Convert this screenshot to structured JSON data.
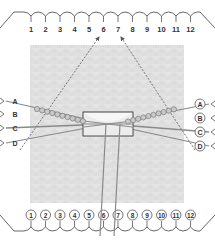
{
  "diagram": {
    "top_labels": [
      "1",
      "2",
      "3",
      "4",
      "5",
      "6",
      "7",
      "8",
      "9",
      "10",
      "11",
      "12"
    ],
    "bottom_labels": [
      "1",
      "2",
      "3",
      "4",
      "5",
      "6",
      "7",
      "8",
      "9",
      "10",
      "11",
      "12"
    ],
    "left_strands": [
      "A",
      "B",
      "C",
      "D"
    ],
    "right_strands": [
      "A",
      "B",
      "C",
      "D"
    ],
    "colors": {
      "line": "#555555",
      "strand": "#8a8a8a",
      "bead_fill": "#c9c9c9",
      "bead_stroke": "#7a7a7a",
      "pattern_bg": "#e4e4e4",
      "pattern_line": "#d2d2d2",
      "box_stroke": "#444444",
      "box_fill": "#f7f7f7"
    }
  }
}
